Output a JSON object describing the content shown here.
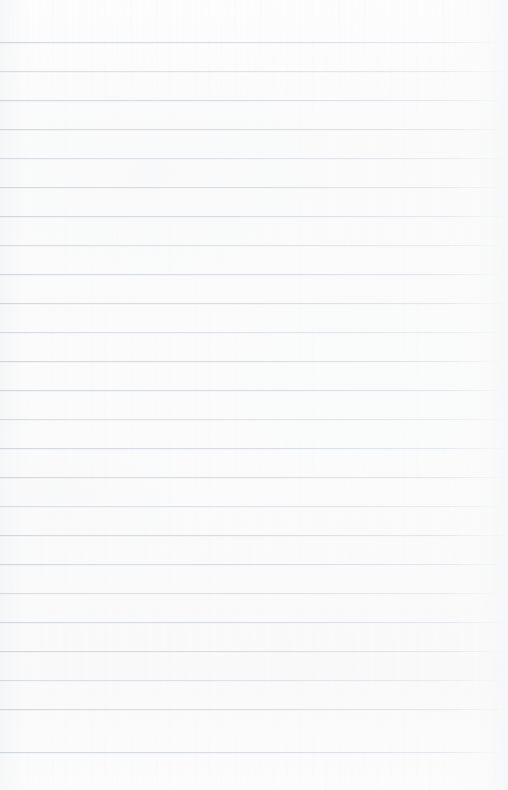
{
  "document": {
    "type": "lined-notebook-page",
    "title": "",
    "body_text": "",
    "has_handwriting": false,
    "has_printed_text": false,
    "page_number": "",
    "header_text": "",
    "footer_text": ""
  },
  "canvas": {
    "width": 508,
    "height": 790
  },
  "paper": {
    "background_color": "#fbfbfb",
    "edge_tint_color": "#f4f5f6",
    "texture": "subtle-scan-grain"
  },
  "ruling": {
    "line_color": "#d8dce1",
    "line_thickness_px": 1,
    "line_spacing_px": 29,
    "first_line_y_px": 42,
    "last_line_y_px": 752,
    "line_count": 25,
    "left_margin_px": 0,
    "right_fade_start_px": 480,
    "has_vertical_margin_rule": false,
    "lines_y": [
      42,
      71,
      100,
      129,
      158,
      187,
      216,
      245,
      274,
      303,
      332,
      361,
      390,
      419,
      448,
      477,
      506,
      535,
      564,
      593,
      622,
      651,
      680,
      709,
      752
    ]
  }
}
